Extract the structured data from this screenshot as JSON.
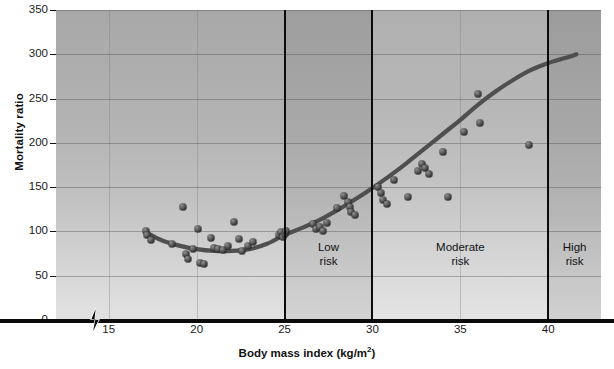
{
  "chart_data": {
    "type": "scatter",
    "title": "",
    "xlabel": "Body mass index (kg/m2)",
    "xlabel_base": "Body mass index (kg/m",
    "xlabel_sup": "2",
    "xlabel_tail": ")",
    "ylabel": "Mortality ratio",
    "xlim": [
      12,
      43
    ],
    "ylim": [
      0,
      350
    ],
    "xticks": [
      15,
      20,
      25,
      30,
      35,
      40
    ],
    "yticks": [
      0,
      50,
      100,
      150,
      200,
      250,
      300,
      350
    ],
    "grid": "horizontal and faint vertical",
    "legend": "none",
    "axis_break": true,
    "series": [
      {
        "name": "Observed mortality ratio",
        "marker": "filled-sphere",
        "points": [
          [
            17.1,
            101
          ],
          [
            17.2,
            96
          ],
          [
            17.4,
            90
          ],
          [
            18.6,
            86
          ],
          [
            19.2,
            128
          ],
          [
            19.4,
            75
          ],
          [
            19.5,
            69
          ],
          [
            19.8,
            80
          ],
          [
            20.1,
            103
          ],
          [
            20.2,
            64
          ],
          [
            20.4,
            63
          ],
          [
            20.8,
            93
          ],
          [
            21.0,
            81
          ],
          [
            21.2,
            80
          ],
          [
            21.5,
            79
          ],
          [
            21.8,
            83
          ],
          [
            22.1,
            111
          ],
          [
            22.4,
            91
          ],
          [
            22.6,
            78
          ],
          [
            22.9,
            84
          ],
          [
            23.2,
            88
          ],
          [
            24.7,
            96
          ],
          [
            24.8,
            99
          ],
          [
            24.9,
            94
          ],
          [
            25.0,
            97
          ],
          [
            25.1,
            101
          ],
          [
            26.6,
            108
          ],
          [
            26.8,
            103
          ],
          [
            27.0,
            105
          ],
          [
            27.2,
            101
          ],
          [
            27.4,
            110
          ],
          [
            28.0,
            126
          ],
          [
            28.4,
            140
          ],
          [
            28.6,
            133
          ],
          [
            28.7,
            128
          ],
          [
            28.8,
            122
          ],
          [
            29.0,
            118
          ],
          [
            30.3,
            150
          ],
          [
            30.5,
            143
          ],
          [
            30.6,
            136
          ],
          [
            30.8,
            131
          ],
          [
            31.2,
            158
          ],
          [
            32.0,
            139
          ],
          [
            32.6,
            168
          ],
          [
            32.8,
            176
          ],
          [
            33.0,
            172
          ],
          [
            33.2,
            165
          ],
          [
            34.0,
            190
          ],
          [
            34.3,
            139
          ],
          [
            35.2,
            212
          ],
          [
            36.0,
            255
          ],
          [
            36.1,
            222
          ],
          [
            38.9,
            198
          ]
        ]
      },
      {
        "name": "Fitted J-shaped curve",
        "type": "line",
        "points": [
          [
            17.2,
            98
          ],
          [
            18.0,
            90
          ],
          [
            19.0,
            84
          ],
          [
            20.0,
            80
          ],
          [
            21.0,
            78
          ],
          [
            22.0,
            78
          ],
          [
            23.0,
            80
          ],
          [
            24.0,
            86
          ],
          [
            25.0,
            96
          ],
          [
            26.0,
            104
          ],
          [
            27.0,
            113
          ],
          [
            28.0,
            124
          ],
          [
            29.0,
            136
          ],
          [
            30.0,
            149
          ],
          [
            31.0,
            163
          ],
          [
            32.0,
            178
          ],
          [
            33.0,
            194
          ],
          [
            34.0,
            210
          ],
          [
            35.0,
            226
          ],
          [
            36.0,
            243
          ],
          [
            37.0,
            258
          ],
          [
            38.0,
            271
          ],
          [
            39.0,
            282
          ],
          [
            40.0,
            290
          ],
          [
            41.0,
            296
          ],
          [
            41.6,
            300
          ]
        ]
      }
    ],
    "zones": [
      {
        "id": "low",
        "label_line1": "Low",
        "label_line2": "risk",
        "x_start": 25,
        "x_end": 30,
        "center": 27.5
      },
      {
        "id": "moderate",
        "label_line1": "Moderate",
        "label_line2": "risk",
        "x_start": 30,
        "x_end": 40,
        "center": 35.0
      },
      {
        "id": "high",
        "label_line1": "High",
        "label_line2": "risk",
        "x_start": 40,
        "x_end": 43,
        "center": 41.5
      }
    ],
    "dividers": [
      25,
      30,
      40
    ],
    "colors": {
      "curve": "#4f4f4f",
      "marker": "#303030",
      "divider": "#0b0b0b",
      "axis": "#0a0a0a",
      "gridline": "#464646",
      "background_top": "#a8a8a8",
      "background_bottom": "#e2e2e2",
      "text": "#1a1a1a"
    }
  }
}
